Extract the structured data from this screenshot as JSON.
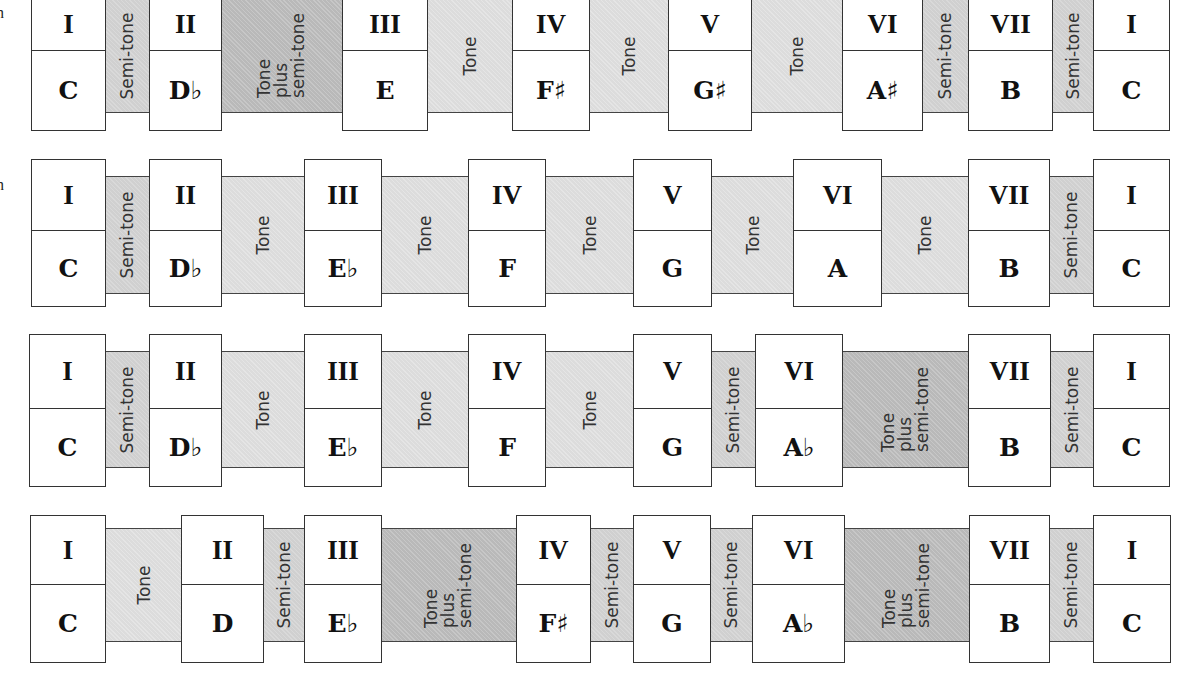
{
  "edge_fragments": [
    "n",
    "n"
  ],
  "scales": [
    {
      "degrees": [
        "I",
        "II",
        "III",
        "IV",
        "V",
        "VI",
        "VII",
        "I"
      ],
      "notes": [
        "C",
        "D♭",
        "E",
        "F♯",
        "G♯",
        "A♯",
        "B",
        "C"
      ],
      "intervals": [
        {
          "type": "semitone",
          "label": "Semi-tone"
        },
        {
          "type": "toneplus",
          "label": "Tone\nplus\nsemi-tone"
        },
        {
          "type": "tone",
          "label": "Tone"
        },
        {
          "type": "tone",
          "label": "Tone"
        },
        {
          "type": "tone",
          "label": "Tone"
        },
        {
          "type": "semitone",
          "label": "Semi-tone"
        },
        {
          "type": "semitone",
          "label": "Semi-tone"
        }
      ]
    },
    {
      "degrees": [
        "I",
        "II",
        "III",
        "IV",
        "V",
        "VI",
        "VII",
        "I"
      ],
      "notes": [
        "C",
        "D♭",
        "E♭",
        "F",
        "G",
        "A",
        "B",
        "C"
      ],
      "intervals": [
        {
          "type": "semitone",
          "label": "Semi-tone"
        },
        {
          "type": "tone",
          "label": "Tone"
        },
        {
          "type": "tone",
          "label": "Tone"
        },
        {
          "type": "tone",
          "label": "Tone"
        },
        {
          "type": "tone",
          "label": "Tone"
        },
        {
          "type": "tone",
          "label": "Tone"
        },
        {
          "type": "semitone",
          "label": "Semi-tone"
        }
      ]
    },
    {
      "degrees": [
        "I",
        "II",
        "III",
        "IV",
        "V",
        "VI",
        "VII",
        "I"
      ],
      "notes": [
        "C",
        "D♭",
        "E♭",
        "F",
        "G",
        "A♭",
        "B",
        "C"
      ],
      "intervals": [
        {
          "type": "semitone",
          "label": "Semi-tone"
        },
        {
          "type": "tone",
          "label": "Tone"
        },
        {
          "type": "tone",
          "label": "Tone"
        },
        {
          "type": "tone",
          "label": "Tone"
        },
        {
          "type": "semitone",
          "label": "Semi-tone"
        },
        {
          "type": "toneplus",
          "label": "Tone\nplus\nsemi-tone"
        },
        {
          "type": "semitone",
          "label": "Semi-tone"
        }
      ]
    },
    {
      "degrees": [
        "I",
        "II",
        "III",
        "IV",
        "V",
        "VI",
        "VII",
        "I"
      ],
      "notes": [
        "C",
        "D",
        "E♭",
        "F♯",
        "G",
        "A♭",
        "B",
        "C"
      ],
      "intervals": [
        {
          "type": "tone",
          "label": "Tone"
        },
        {
          "type": "semitone",
          "label": "Semi-tone"
        },
        {
          "type": "toneplus",
          "label": "Tone\nplus\nsemi-tone"
        },
        {
          "type": "semitone",
          "label": "Semi-tone"
        },
        {
          "type": "semitone",
          "label": "Semi-tone"
        },
        {
          "type": "toneplus",
          "label": "Tone\nplus\nsemi-tone"
        },
        {
          "type": "semitone",
          "label": "Semi-tone"
        }
      ]
    }
  ]
}
